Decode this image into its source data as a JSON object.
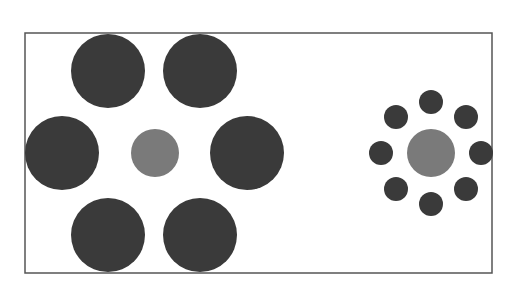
{
  "diagram": {
    "type": "ebbinghaus-illusion",
    "frame": {
      "x": 25,
      "y": 33,
      "width": 467,
      "height": 240,
      "stroke": "#555555"
    },
    "colors": {
      "inducer": "#3a3a3a",
      "target": "#7a7a7a",
      "background": "#ffffff"
    },
    "left_group": {
      "target": {
        "cx": 155,
        "cy": 153,
        "r": 24
      },
      "inducers": [
        {
          "cx": 108,
          "cy": 71,
          "r": 37
        },
        {
          "cx": 200,
          "cy": 71,
          "r": 37
        },
        {
          "cx": 62,
          "cy": 153,
          "r": 37
        },
        {
          "cx": 247,
          "cy": 153,
          "r": 37
        },
        {
          "cx": 108,
          "cy": 235,
          "r": 37
        },
        {
          "cx": 200,
          "cy": 235,
          "r": 37
        }
      ]
    },
    "right_group": {
      "target": {
        "cx": 431,
        "cy": 153,
        "r": 24
      },
      "inducers": [
        {
          "cx": 431,
          "cy": 102,
          "r": 12
        },
        {
          "cx": 466,
          "cy": 117,
          "r": 12
        },
        {
          "cx": 481,
          "cy": 153,
          "r": 12
        },
        {
          "cx": 466,
          "cy": 189,
          "r": 12
        },
        {
          "cx": 431,
          "cy": 204,
          "r": 12
        },
        {
          "cx": 396,
          "cy": 189,
          "r": 12
        },
        {
          "cx": 381,
          "cy": 153,
          "r": 12
        },
        {
          "cx": 396,
          "cy": 117,
          "r": 12
        }
      ]
    }
  }
}
